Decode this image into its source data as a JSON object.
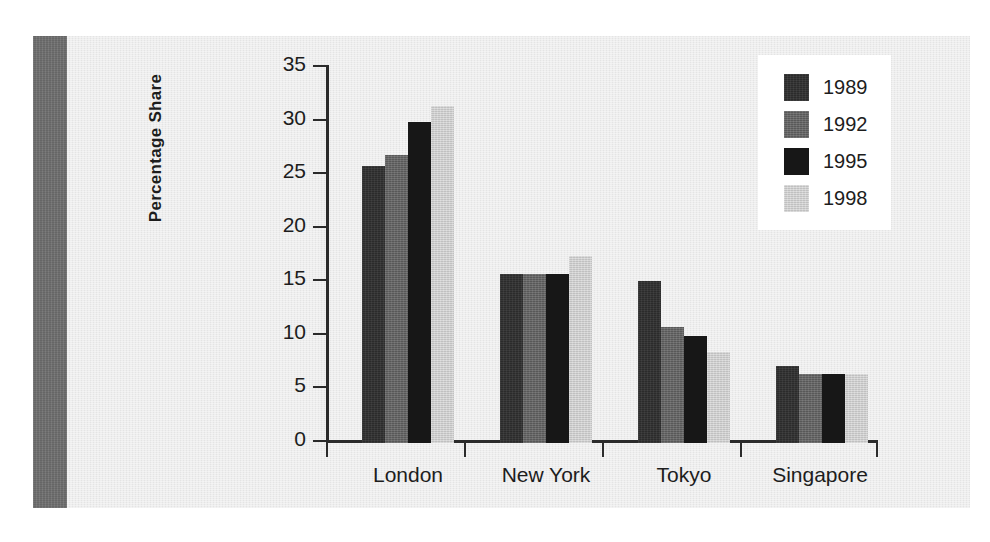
{
  "chart_data": {
    "type": "bar",
    "title": "",
    "subtitle": "",
    "xlabel": "",
    "ylabel": "Percentage Share",
    "categories": [
      "London",
      "New York",
      "Tokyo",
      "Singapore"
    ],
    "series": [
      {
        "name": "1989",
        "color": "#2b2b2b",
        "values": [
          25.9,
          15.8,
          15.1,
          7.2
        ]
      },
      {
        "name": "1992",
        "color": "#606060",
        "values": [
          26.9,
          15.8,
          10.8,
          6.4
        ]
      },
      {
        "name": "1995",
        "color": "#171717",
        "values": [
          30.0,
          15.8,
          10.0,
          6.4
        ]
      },
      {
        "name": "1998",
        "color": "#cacaca",
        "values": [
          31.5,
          17.5,
          8.5,
          6.4
        ]
      }
    ],
    "ylim": [
      0,
      35
    ],
    "ytick_values": [
      0,
      5,
      10,
      15,
      20,
      25,
      30,
      35
    ],
    "ytick_labels": [
      "0",
      "5",
      "10",
      "15",
      "20",
      "25",
      "30",
      "35"
    ],
    "grid": false,
    "legend_position": "top-right",
    "legend_entries": [
      "1989",
      "1992",
      "1995",
      "1998"
    ],
    "annotations": []
  },
  "figure": {
    "background_color": "#eaeaea",
    "page_color": "#ffffff",
    "spine_color": "#6f6f6f",
    "axis_color": "#2b2b2b",
    "text_color": "#1d1d1d",
    "legend_background": "#ffffff"
  }
}
